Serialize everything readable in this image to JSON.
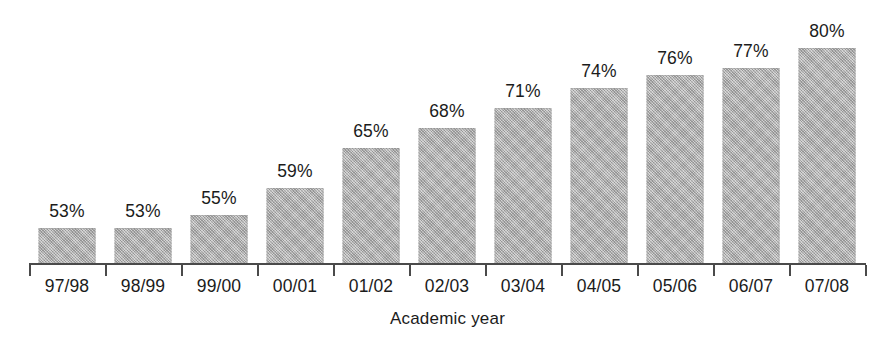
{
  "chart_data": {
    "type": "bar",
    "title": "",
    "subtitle": "",
    "xlabel": "Academic year",
    "ylabel": "",
    "categories": [
      "97/98",
      "98/99",
      "99/00",
      "00/01",
      "01/02",
      "02/03",
      "03/04",
      "04/05",
      "05/06",
      "06/07",
      "07/08"
    ],
    "values": [
      53,
      53,
      55,
      59,
      65,
      68,
      71,
      74,
      76,
      77,
      80
    ],
    "value_labels": [
      "53%",
      "53%",
      "55%",
      "59%",
      "65%",
      "68%",
      "71%",
      "74%",
      "76%",
      "77%",
      "80%"
    ],
    "value_unit": "%",
    "ylim": [
      47.5,
      80
    ],
    "y_axis_truncated": true,
    "grid": false,
    "legend": null,
    "legend_position": "none",
    "series": [
      {
        "name": "",
        "values": [
          53,
          53,
          55,
          59,
          65,
          68,
          71,
          74,
          76,
          77,
          80
        ]
      }
    ],
    "annotations": []
  },
  "style": {
    "background_color": "#ffffff",
    "bar_color": "#a9a9a9",
    "axis_color": "#4a4a4a",
    "text_color": "#1b1b1b"
  },
  "layout": {
    "axis_left": 29,
    "axis_right": 866,
    "baseline_y": 263,
    "slot_width": 76,
    "bar_width": 57,
    "px_per_percent": 6.667,
    "value_baseline_percent": 47.5
  }
}
